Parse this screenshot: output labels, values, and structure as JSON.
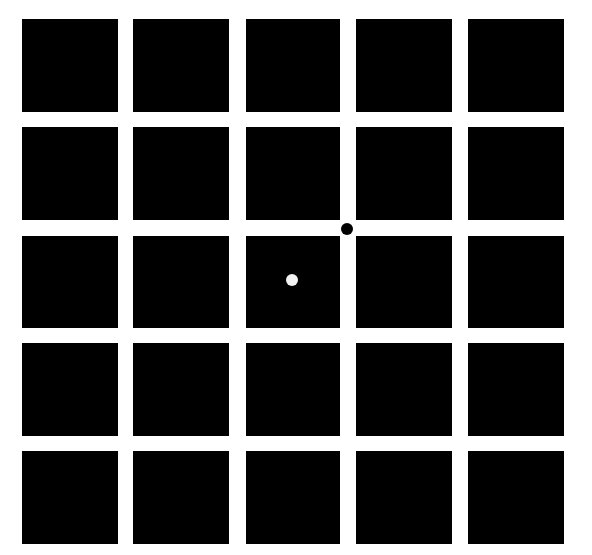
{
  "figure": {
    "background_color": "#ffffff",
    "square_color": "#000000",
    "grid": {
      "rows": 5,
      "cols": 5,
      "col_x": [
        22,
        133,
        246,
        356,
        468
      ],
      "col_w": [
        96,
        96,
        94,
        96,
        96
      ],
      "row_y": [
        19,
        127,
        236,
        343,
        451
      ],
      "row_h": [
        93,
        93,
        92,
        93,
        93
      ]
    },
    "dots": [
      {
        "name": "black-dot",
        "color": "#000000",
        "cx": 347,
        "cy": 229,
        "r": 6,
        "location": "intersection between row 2/3 and column 3/4"
      },
      {
        "name": "white-dot",
        "color": "#f2f2f2",
        "cx": 292,
        "cy": 280,
        "r": 6,
        "location": "center of square row 3, column 3"
      }
    ],
    "caption": ""
  }
}
